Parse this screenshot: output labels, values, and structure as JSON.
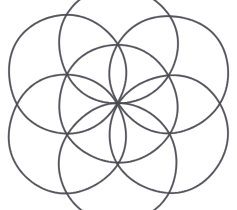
{
  "figure": {
    "title": "Seed of Life",
    "medium": "pencil line drawing",
    "background_color": "#ffffff",
    "stroke_color": "#4a4a52",
    "stroke_width": 1.7,
    "canvas": {
      "width": 237,
      "height": 210
    },
    "geometry": {
      "center_x": 118,
      "center_y": 104,
      "radius": 59,
      "ring_count": 6,
      "total_circles": 7,
      "angle_step_degrees": 60,
      "start_angle_degrees": 90
    },
    "circles": [
      {
        "name": "center-circle",
        "cx": 118,
        "cy": 104,
        "r": 59
      },
      {
        "name": "ring-circle-top",
        "cx": 118,
        "cy": 45,
        "r": 59
      },
      {
        "name": "ring-circle-upper-right",
        "cx": 169,
        "cy": 74,
        "r": 59
      },
      {
        "name": "ring-circle-lower-right",
        "cx": 169,
        "cy": 134,
        "r": 59
      },
      {
        "name": "ring-circle-bottom",
        "cx": 118,
        "cy": 163,
        "r": 59
      },
      {
        "name": "ring-circle-lower-left",
        "cx": 67,
        "cy": 134,
        "r": 59
      },
      {
        "name": "ring-circle-upper-left",
        "cx": 67,
        "cy": 74,
        "r": 59
      }
    ]
  }
}
